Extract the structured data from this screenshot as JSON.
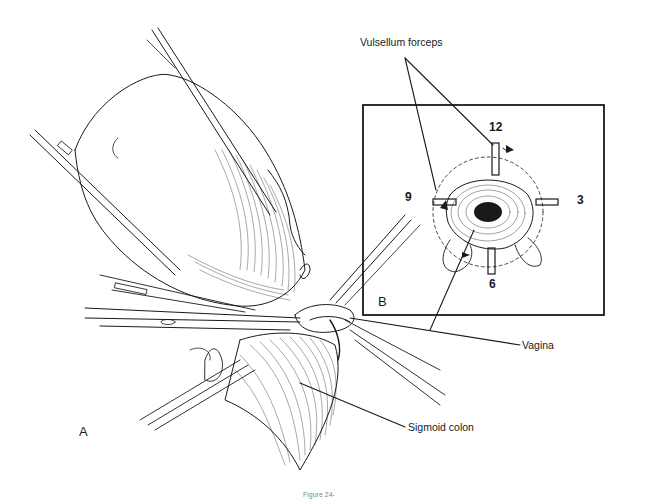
{
  "figure": {
    "caption": "Figure 24-",
    "panels": [
      {
        "id": "A",
        "label": "A"
      },
      {
        "id": "B",
        "label": "B"
      }
    ]
  },
  "labels": {
    "vulsellum_forceps": "Vulsellum forceps",
    "vagina": "Vagina",
    "sigmoid_colon": "Sigmoid colon"
  },
  "clock_positions": {
    "top": "12",
    "right": "3",
    "bottom": "6",
    "left": "9"
  },
  "colors": {
    "ink": "#1a1a1a",
    "background": "#ffffff"
  }
}
